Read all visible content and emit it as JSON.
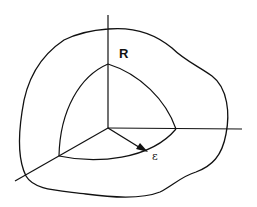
{
  "diagram": {
    "labels": {
      "region": "R",
      "radius": "ε"
    },
    "colors": {
      "stroke": "#111111",
      "background": "#ffffff"
    }
  }
}
